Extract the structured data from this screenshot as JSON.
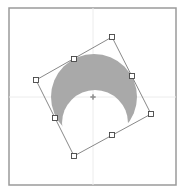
{
  "canvas": {
    "width": 186,
    "height": 193,
    "background": "#ffffff"
  },
  "frame": {
    "x": 9,
    "y": 8,
    "width": 167,
    "height": 177,
    "stroke": "#9a9a9a"
  },
  "guides": {
    "center_x": 93,
    "center_y": 97,
    "stroke": "#ececec"
  },
  "shape": {
    "type": "crescent",
    "fill": "#a9a9a9",
    "outer_circle": {
      "cx": 94,
      "cy": 97,
      "r": 43
    },
    "inner_circle": {
      "cx": 95,
      "cy": 123,
      "r": 33
    }
  },
  "selection_box": {
    "stroke": "#6a6a6a",
    "corners": [
      {
        "name": "top",
        "x": 112,
        "y": 37
      },
      {
        "name": "right",
        "x": 151,
        "y": 114
      },
      {
        "name": "bottom",
        "x": 74,
        "y": 156
      },
      {
        "name": "left",
        "x": 36,
        "y": 80
      }
    ],
    "midpoints": [
      {
        "name": "top-left-edge",
        "x": 74,
        "y": 59
      },
      {
        "name": "top-right-edge",
        "x": 132,
        "y": 76
      },
      {
        "name": "bottom-right-edge",
        "x": 112,
        "y": 135
      },
      {
        "name": "bottom-left-edge",
        "x": 55,
        "y": 118
      }
    ]
  },
  "center_marker": {
    "x": 93,
    "y": 97,
    "color": "#888888"
  }
}
